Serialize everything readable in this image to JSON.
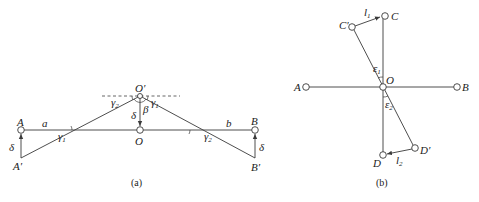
{
  "figure_a": {
    "caption": "(a)",
    "points": {
      "A": "A",
      "A_prime": "A′",
      "B": "B",
      "B_prime": "B′",
      "O": "O",
      "O_prime": "O′"
    },
    "segments": {
      "a": "a",
      "b": "b"
    },
    "angles": {
      "gamma1_left": "γ",
      "gamma1_left_sub": "1",
      "gamma2_left": "γ",
      "gamma2_left_sub": "2",
      "gamma1_right": "γ",
      "gamma1_right_sub": "1",
      "gamma2_right": "γ",
      "gamma2_right_sub": "2",
      "beta": "β"
    },
    "displacements": {
      "delta_A": "δ",
      "delta_O": "δ",
      "delta_B": "δ"
    }
  },
  "figure_b": {
    "caption": "(b)",
    "points": {
      "A": "A",
      "B": "B",
      "O": "O",
      "C": "C",
      "C_prime": "C′",
      "D": "D",
      "D_prime": "D′"
    },
    "displacements": {
      "l1": "l",
      "l1_sub": "1",
      "l2": "l",
      "l2_sub": "2"
    },
    "angles": {
      "eps1": "ε",
      "eps1_sub": "1",
      "eps2": "ε",
      "eps2_sub": "2"
    }
  }
}
